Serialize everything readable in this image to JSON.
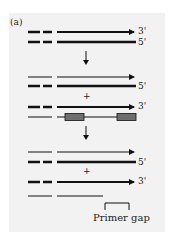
{
  "panel_label": "(a)",
  "colors": {
    "background": "#f2f2f2",
    "strand": "#111111",
    "primer_box": "#6e6e6e"
  },
  "steps": [
    {
      "rows": [
        {
          "strand": "top",
          "end_label": "3'",
          "style": "thick-arrow"
        },
        {
          "strand": "bottom",
          "end_label": "5'",
          "style": "thick"
        }
      ]
    },
    {
      "rows": [
        {
          "strand": "new",
          "style": "thin-arrow"
        },
        {
          "strand": "template",
          "end_label": "5'",
          "style": "thick"
        },
        {
          "operator": "+"
        },
        {
          "strand": "template",
          "end_label": "3'",
          "style": "thick-arrow"
        },
        {
          "strand": "new",
          "style": "thin-with-primers"
        }
      ]
    },
    {
      "rows": [
        {
          "strand": "new",
          "style": "thin-arrow"
        },
        {
          "strand": "template",
          "end_label": "5'",
          "style": "thick"
        },
        {
          "operator": "+"
        },
        {
          "strand": "template",
          "end_label": "3'",
          "style": "thick-arrow"
        },
        {
          "strand": "new",
          "style": "thin-short"
        }
      ]
    }
  ],
  "labels": {
    "row1_end": "3'",
    "row2_end": "5'",
    "row4_end": "5'",
    "row5_end": "3'",
    "row8_end": "5'",
    "row9_end": "3'",
    "plus1": "+",
    "plus2": "+",
    "primer_gap": "Primer gap"
  }
}
